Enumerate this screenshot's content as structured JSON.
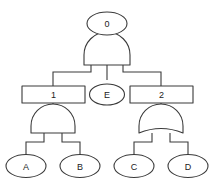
{
  "diagram": {
    "kind": "fault-tree",
    "colors": {
      "background": "#ffffff",
      "stroke": "#3a3a3a",
      "text": "#222222",
      "fill": "#ffffff"
    },
    "nodes": {
      "top_event": {
        "id": "0",
        "label": "0",
        "shape": "ellipse"
      },
      "intermediate_left": {
        "id": "1",
        "label": "1",
        "shape": "rectangle"
      },
      "basic_middle": {
        "id": "E",
        "label": "E",
        "shape": "ellipse"
      },
      "intermediate_right": {
        "id": "2",
        "label": "2",
        "shape": "rectangle"
      },
      "basic_a": {
        "id": "A",
        "label": "A",
        "shape": "ellipse"
      },
      "basic_b": {
        "id": "B",
        "label": "B",
        "shape": "ellipse"
      },
      "basic_c": {
        "id": "C",
        "label": "C",
        "shape": "ellipse"
      },
      "basic_d": {
        "id": "D",
        "label": "D",
        "shape": "ellipse"
      }
    },
    "gates": {
      "top_gate": {
        "type": "AND",
        "inputs": [
          "1",
          "E",
          "2"
        ],
        "output": "0"
      },
      "left_gate": {
        "type": "AND",
        "inputs": [
          "A",
          "B"
        ],
        "output": "1"
      },
      "right_gate": {
        "type": "OR",
        "inputs": [
          "C",
          "D"
        ],
        "output": "2"
      }
    }
  }
}
